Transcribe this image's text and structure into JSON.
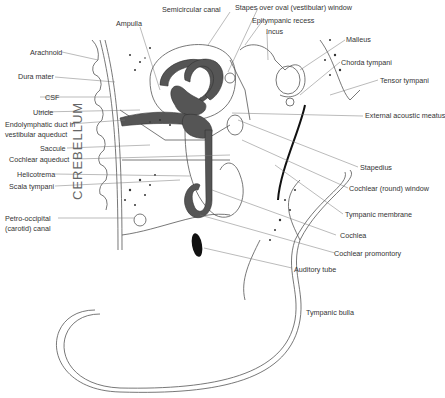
{
  "figure": {
    "region_label": "CEREBELLUM",
    "signature": "signature",
    "labels_left": [
      {
        "id": "arachnoid",
        "text": "Arachnoid"
      },
      {
        "id": "dura-mater",
        "text": "Dura mater"
      },
      {
        "id": "csf",
        "text": "CSF"
      },
      {
        "id": "utricle",
        "text": "Utricle"
      },
      {
        "id": "endolymphatic-duct-1",
        "text": "Endolymphatic duct in"
      },
      {
        "id": "endolymphatic-duct-2",
        "text": "vestibular aqueduct"
      },
      {
        "id": "saccule",
        "text": "Saccule"
      },
      {
        "id": "cochlear-aqueduct",
        "text": "Cochlear aqueduct"
      },
      {
        "id": "helicotrema",
        "text": "Helicotrema"
      },
      {
        "id": "scala-tympani",
        "text": "Scala tympani"
      },
      {
        "id": "petro-occipital-1",
        "text": "Petro-occipital"
      },
      {
        "id": "petro-occipital-2",
        "text": "(carotid) canal"
      }
    ],
    "labels_top": [
      {
        "id": "ampulla",
        "text": "Ampulla"
      },
      {
        "id": "semicircular-canal",
        "text": "Semicircular canal"
      },
      {
        "id": "stapes",
        "text": "Stapes over oval (vestibular) window"
      },
      {
        "id": "epitympanic-recess",
        "text": "Epitympanic recess"
      },
      {
        "id": "incus",
        "text": "Incus"
      }
    ],
    "labels_right": [
      {
        "id": "malleus",
        "text": "Malleus"
      },
      {
        "id": "chorda-tympani",
        "text": "Chorda tympani"
      },
      {
        "id": "tensor-tympani",
        "text": "Tensor tympani"
      },
      {
        "id": "external-acoustic-meatus",
        "text": "External acoustic meatus"
      },
      {
        "id": "stapedius",
        "text": "Stapedius"
      },
      {
        "id": "cochlear-round-window",
        "text": "Cochlear (round) window"
      },
      {
        "id": "tympanic-membrane",
        "text": "Tympanic membrane"
      },
      {
        "id": "cochlea",
        "text": "Cochlea"
      },
      {
        "id": "cochlear-promontory",
        "text": "Cochlear promontory"
      },
      {
        "id": "auditory-tube",
        "text": "Auditory tube"
      },
      {
        "id": "tympanic-bulla",
        "text": "Tympanic bulla"
      }
    ]
  }
}
